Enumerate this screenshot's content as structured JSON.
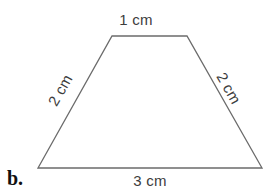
{
  "figure": {
    "letter": "b.",
    "stroke_color": "#6b6b6b",
    "label_color": "#3d3d3d",
    "background_color": "#ffffff",
    "shape": "trapezoid"
  },
  "labels": {
    "top": "1 cm",
    "left": "2 cm",
    "right": "2 cm",
    "bottom": "3 cm"
  },
  "chart_data": {
    "type": "diagram",
    "title": "b.",
    "shape": "trapezoid",
    "vertices": [
      {
        "name": "top-left",
        "x": 112,
        "y": 36
      },
      {
        "name": "top-right",
        "x": 187,
        "y": 36
      },
      {
        "name": "bottom-right",
        "x": 262,
        "y": 168
      },
      {
        "name": "bottom-left",
        "x": 38,
        "y": 168
      }
    ],
    "sides": [
      {
        "name": "top",
        "label": "1 cm",
        "value": 1,
        "unit": "cm"
      },
      {
        "name": "right",
        "label": "2 cm",
        "value": 2,
        "unit": "cm"
      },
      {
        "name": "bottom",
        "label": "3 cm",
        "value": 3,
        "unit": "cm"
      },
      {
        "name": "left",
        "label": "2 cm",
        "value": 2,
        "unit": "cm"
      }
    ],
    "perimeter": 8,
    "unit": "cm"
  }
}
